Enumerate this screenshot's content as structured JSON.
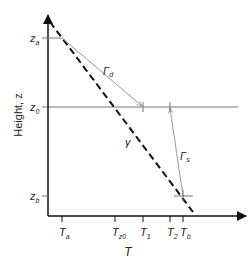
{
  "diagram": {
    "y_axis_label": "Height, z",
    "x_axis_label": "T",
    "y_ticks": [
      {
        "main": "z",
        "sub": "a"
      },
      {
        "main": "z",
        "sub": "0"
      },
      {
        "main": "z",
        "sub": "b"
      }
    ],
    "x_ticks": [
      {
        "main": "T",
        "sub": "a"
      },
      {
        "main": "T",
        "sub": "z0"
      },
      {
        "main": "T",
        "sub": "1"
      },
      {
        "main": "T",
        "sub": "2"
      },
      {
        "main": "T",
        "sub": "b"
      }
    ],
    "lines": {
      "dry_adiabat": {
        "main": "Γ",
        "sub": "d"
      },
      "saturated_adiabat": {
        "main": "Γ",
        "sub": "s"
      },
      "environmental_lapse": {
        "label": "γ"
      }
    },
    "colors": {
      "axis": "#111111",
      "reference": "#777777",
      "adiabat": "#999999",
      "dashed": "#111111"
    }
  }
}
